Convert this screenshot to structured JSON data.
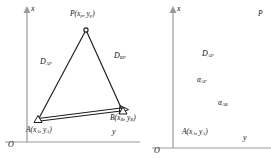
{
  "figure": {
    "line_color": "#1a1a1a",
    "axis_color": "#9a9a9a",
    "panels": [
      {
        "id": "left",
        "axes": {
          "vertical_label": "x",
          "horizontal_label": "y",
          "origin_label": "O"
        },
        "points": [
          {
            "name": "P",
            "label": "P",
            "coords": "(x",
            "coord_sub1": "p",
            "coord_mid": ", y",
            "coord_sub2": "p",
            "coord_end": ")"
          },
          {
            "name": "A",
            "label": "A",
            "coords": "(x",
            "coord_sub1": "A",
            "coord_mid": ", y",
            "coord_sub2": "A",
            "coord_end": ")"
          },
          {
            "name": "B",
            "label": "B",
            "coords": "(x",
            "coord_sub1": "B",
            "coord_mid": ", y",
            "coord_sub2": "B",
            "coord_end": ")"
          }
        ],
        "distances": [
          {
            "name": "D-AP",
            "base": "D",
            "sub": "AP"
          },
          {
            "name": "D-BP",
            "base": "D",
            "sub": "BP"
          }
        ]
      },
      {
        "id": "right",
        "axes": {
          "vertical_label": "x",
          "horizontal_label": "y",
          "origin_label": "O"
        },
        "points": [
          {
            "name": "P",
            "label": "P",
            "coords": "",
            "coord_sub1": "",
            "coord_mid": "",
            "coord_sub2": "",
            "coord_end": ""
          },
          {
            "name": "A",
            "label": "A",
            "coords": "(x",
            "coord_sub1": "A",
            "coord_mid": ", y",
            "coord_sub2": "A",
            "coord_end": ")"
          }
        ],
        "distances": [
          {
            "name": "D-AP",
            "base": "D",
            "sub": "AP"
          }
        ],
        "angles": [
          {
            "name": "alpha-AP",
            "base": "α",
            "sub": "AP"
          },
          {
            "name": "alpha-AB",
            "base": "α",
            "sub": "AB"
          }
        ]
      }
    ]
  },
  "left": {
    "axis_x": "x",
    "axis_y": "y",
    "origin": "O",
    "P_name": "P",
    "P_open": "(x",
    "P_sub1": "p",
    "P_mid": ", y",
    "P_sub2": "p",
    "P_close": ")",
    "A_name": "A",
    "A_open": "(x",
    "A_sub1": "A",
    "A_mid": ", y",
    "A_sub2": "A",
    "A_close": ")",
    "B_name": "B",
    "B_open": "(x",
    "B_sub1": "B",
    "B_mid": ", y",
    "B_sub2": "B",
    "B_close": ")",
    "D_AP_base": "D",
    "D_AP_sub": "AP",
    "D_BP_base": "D",
    "D_BP_sub": "BP"
  },
  "right": {
    "axis_x": "x",
    "axis_y": "y",
    "origin": "O",
    "P_name": "P",
    "A_name": "A",
    "A_open": "(x",
    "A_sub1": "A",
    "A_mid": ", y",
    "A_sub2": "A",
    "A_close": ")",
    "D_AP_base": "D",
    "D_AP_sub": "AP",
    "alpha_AP_base": "α",
    "alpha_AP_sub": "AP",
    "alpha_AB_base": "α",
    "alpha_AB_sub": "AB"
  }
}
